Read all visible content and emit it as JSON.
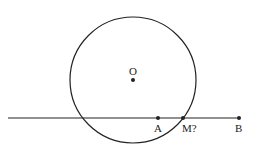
{
  "diagram": {
    "circle": {
      "cx": 133,
      "cy": 80,
      "r": 63,
      "stroke": "#222222"
    },
    "line": {
      "x1": 8,
      "y1": 118,
      "x2": 240,
      "y2": 118
    },
    "points": [
      {
        "id": "O",
        "label": "O",
        "x": 133,
        "y": 80,
        "label_x": 129,
        "label_y": 75
      },
      {
        "id": "A",
        "label": "A",
        "x": 158,
        "y": 118,
        "label_x": 154,
        "label_y": 132
      },
      {
        "id": "M",
        "label": "M?",
        "x": 183,
        "y": 118,
        "label_x": 182,
        "label_y": 132
      },
      {
        "id": "B",
        "label": "B",
        "x": 239,
        "y": 118,
        "label_x": 235,
        "label_y": 132
      }
    ]
  }
}
